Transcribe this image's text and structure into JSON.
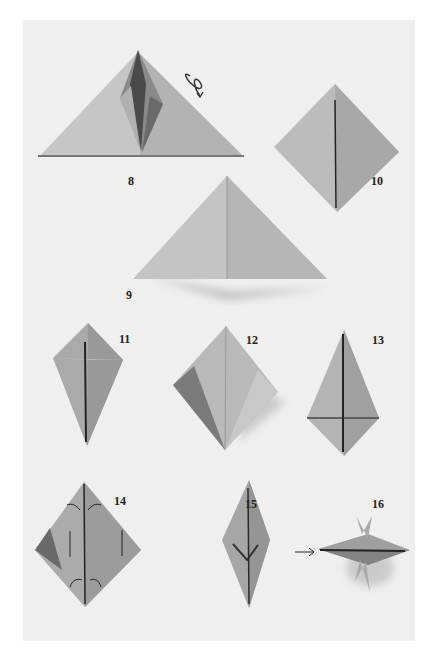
{
  "page": {
    "background": "#ffffff",
    "photo_background": "#efefef",
    "paper_light": "#c9c9c9",
    "paper_mid": "#a9a9a9",
    "paper_dark": "#6e6e6e"
  },
  "steps": [
    {
      "number": "8",
      "label_x": 128,
      "label_y": 174,
      "shape": "triangle-with-crane-base",
      "annotation": "turn-over-icon"
    },
    {
      "number": "9",
      "label_x": 126,
      "label_y": 288,
      "shape": "triangle"
    },
    {
      "number": "10",
      "label_x": 371,
      "label_y": 174,
      "shape": "diamond"
    },
    {
      "number": "11",
      "label_x": 119,
      "label_y": 332,
      "shape": "kite"
    },
    {
      "number": "12",
      "label_x": 246,
      "label_y": 333,
      "shape": "kite-with-folded-flaps"
    },
    {
      "number": "13",
      "label_x": 372,
      "label_y": 333,
      "shape": "kite-inverted"
    },
    {
      "number": "14",
      "label_x": 114,
      "label_y": 494,
      "shape": "diamond-with-fold-arrows",
      "annotation": "fold-arrows"
    },
    {
      "number": "15",
      "label_x": 245,
      "label_y": 497,
      "shape": "narrow-diamond"
    },
    {
      "number": "16",
      "label_x": 372,
      "label_y": 497,
      "shape": "3d-star",
      "annotation": "push-arrow-icon"
    }
  ]
}
